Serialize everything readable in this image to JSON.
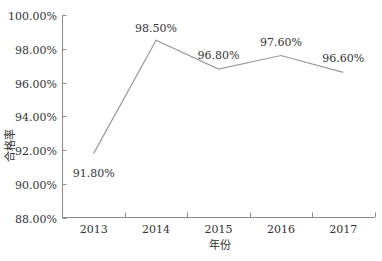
{
  "chart_data": {
    "type": "line",
    "title": "",
    "xlabel": "年份",
    "ylabel": "合格率",
    "categories": [
      "2013",
      "2014",
      "2015",
      "2016",
      "2017"
    ],
    "series": [
      {
        "name": "合格率",
        "values": [
          91.8,
          98.5,
          96.8,
          97.6,
          96.6
        ]
      }
    ],
    "data_labels": [
      "91.80%",
      "98.50%",
      "96.80%",
      "97.60%",
      "96.60%"
    ],
    "y_ticks": [
      "88.00%",
      "90.00%",
      "92.00%",
      "94.00%",
      "96.00%",
      "98.00%",
      "100.00%"
    ],
    "ylim": [
      88,
      100
    ],
    "grid": false,
    "legend": "none",
    "colors": {
      "line": "#9a9a9a",
      "axis": "#8a8a8a",
      "text": "#333333"
    }
  }
}
